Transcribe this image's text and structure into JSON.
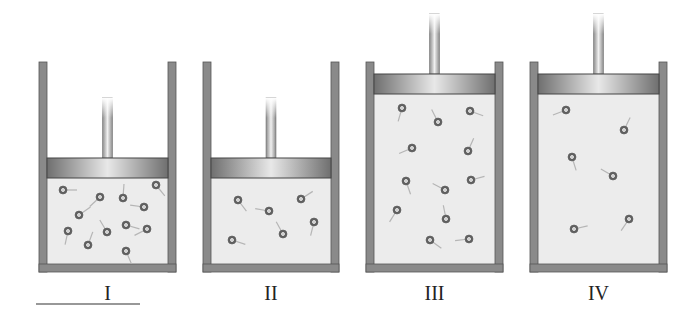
{
  "figure": {
    "colors": {
      "wall": "#8a8a8a",
      "gas": "#ececec",
      "piston": "#9a9a9a",
      "particle": "#777777",
      "tail": "#b5b5b5"
    },
    "containers": [
      {
        "label": "I",
        "x": 39,
        "top": 62,
        "width": 137,
        "bottom": 272,
        "piston_y": 158,
        "particles": [
          [
            63,
            190
          ],
          [
            100,
            197
          ],
          [
            123,
            198
          ],
          [
            156,
            185
          ],
          [
            144,
            207
          ],
          [
            79,
            215
          ],
          [
            68,
            231
          ],
          [
            107,
            232
          ],
          [
            126,
            225
          ],
          [
            147,
            229
          ],
          [
            88,
            245
          ],
          [
            126,
            251
          ]
        ],
        "underline": true
      },
      {
        "label": "II",
        "x": 203,
        "top": 62,
        "width": 136,
        "bottom": 272,
        "piston_y": 158,
        "particles": [
          [
            238,
            200
          ],
          [
            269,
            211
          ],
          [
            301,
            199
          ],
          [
            314,
            222
          ],
          [
            283,
            234
          ],
          [
            232,
            240
          ]
        ]
      },
      {
        "label": "III",
        "x": 366,
        "top": 62,
        "width": 137,
        "bottom": 272,
        "piston_y": 74,
        "particles": [
          [
            402,
            108
          ],
          [
            438,
            122
          ],
          [
            470,
            111
          ],
          [
            412,
            148
          ],
          [
            468,
            151
          ],
          [
            406,
            181
          ],
          [
            445,
            190
          ],
          [
            471,
            180
          ],
          [
            397,
            210
          ],
          [
            446,
            219
          ],
          [
            430,
            240
          ],
          [
            469,
            239
          ]
        ]
      },
      {
        "label": "IV",
        "x": 530,
        "top": 62,
        "width": 137,
        "bottom": 272,
        "piston_y": 74,
        "particles": [
          [
            566,
            110
          ],
          [
            624,
            130
          ],
          [
            572,
            157
          ],
          [
            613,
            176
          ],
          [
            574,
            229
          ],
          [
            629,
            219
          ]
        ]
      }
    ]
  }
}
